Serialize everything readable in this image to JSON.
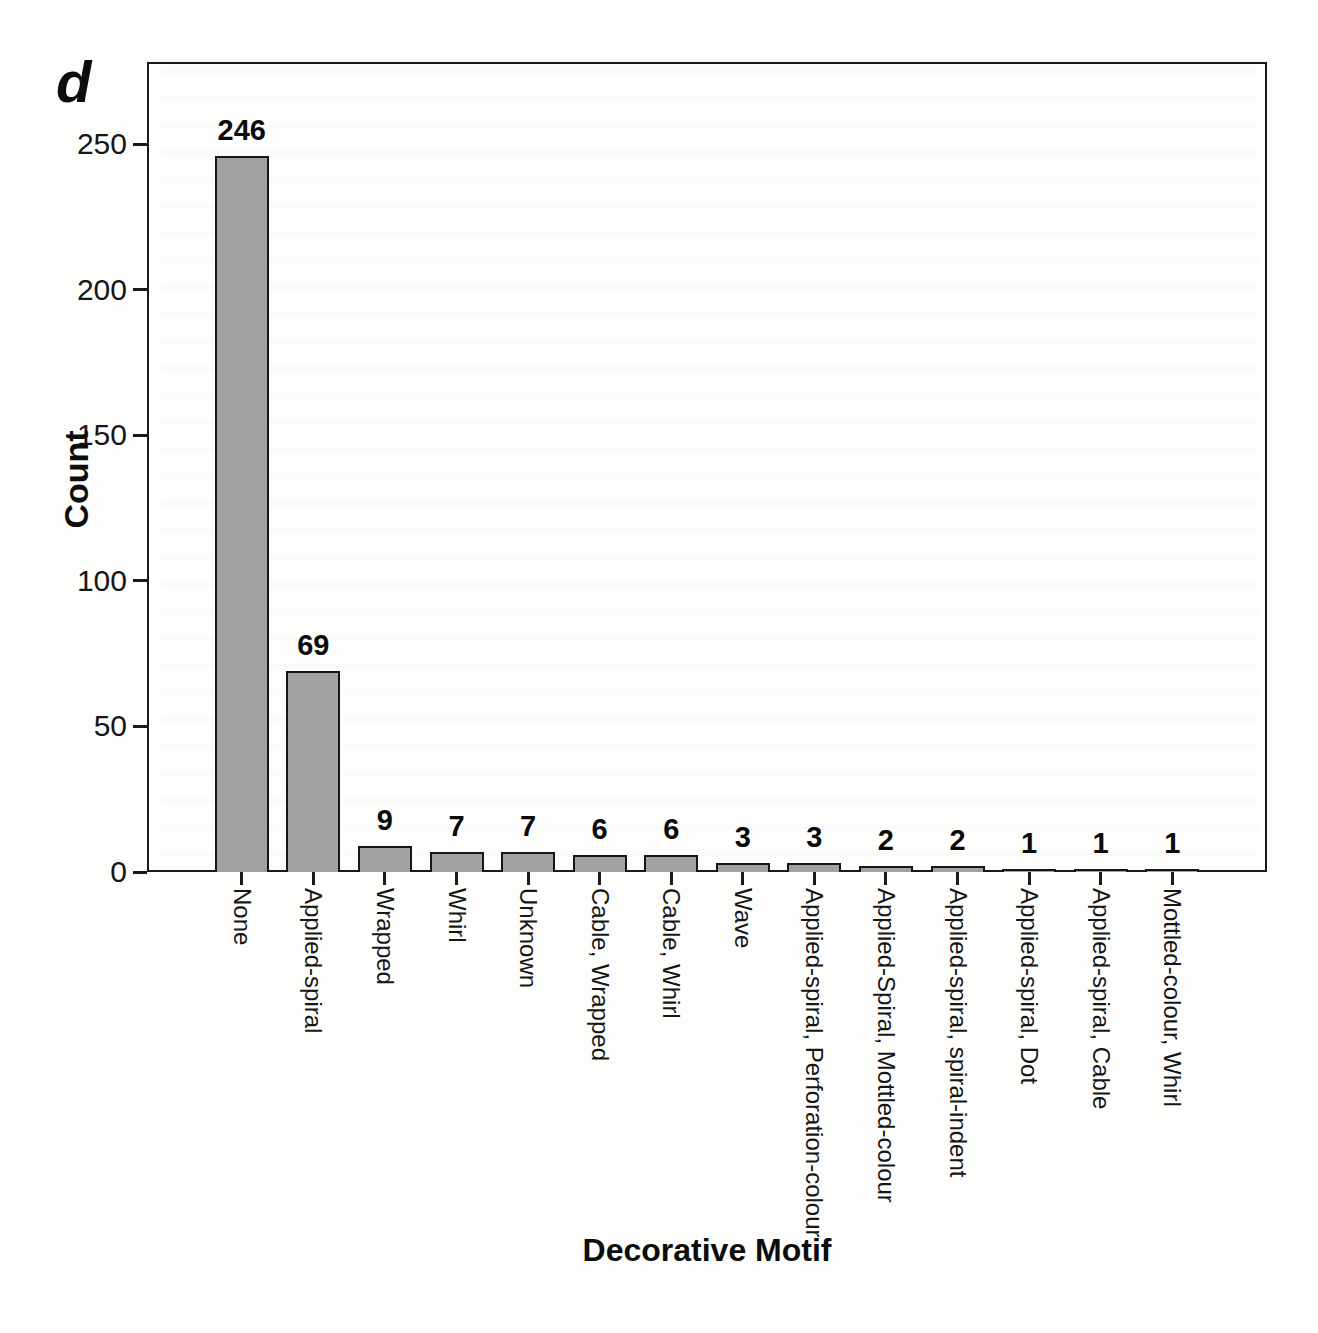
{
  "panel_label": "d",
  "colors": {
    "bar_fill": "#a2a2a2",
    "bar_border": "#161616",
    "axis": "#1a1a1a",
    "background": "#fdfdfb"
  },
  "chart_data": {
    "type": "bar",
    "title": "",
    "xlabel": "Decorative Motif",
    "ylabel": "Count",
    "categories": [
      "None",
      "Applied-spiral",
      "Wrapped",
      "Whirl",
      "Unknown",
      "Cable, Wrapped",
      "Cable, Whirl",
      "Wave",
      "Applied-spiral, Perforation-colour",
      "Applied-Spiral, Mottled-colour",
      "Applied-spiral, spiral-indent",
      "Applied-spiral, Dot",
      "Applied-spiral, Cable",
      "Mottled-colour, Whirl"
    ],
    "values": [
      246,
      69,
      9,
      7,
      7,
      6,
      6,
      3,
      3,
      2,
      2,
      1,
      1,
      1
    ],
    "bar_labels": [
      "246",
      "69",
      "9",
      "7",
      "7",
      "6",
      "6",
      "3",
      "3",
      "2",
      "2",
      "1",
      "1",
      "1"
    ],
    "ylim": [
      0,
      250
    ],
    "yticks": [
      0,
      50,
      100,
      150,
      200,
      250
    ],
    "grid": false,
    "legend": null,
    "bar_label_position": "above"
  }
}
